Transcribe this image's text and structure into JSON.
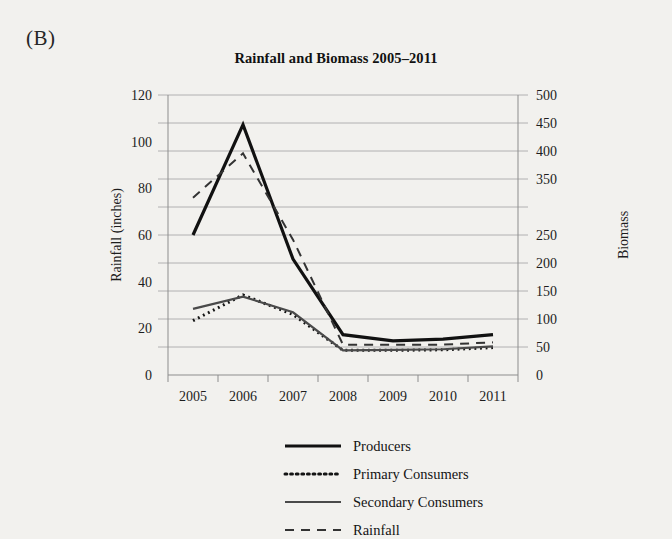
{
  "panel": {
    "label": "(B)"
  },
  "chart_data": {
    "type": "line",
    "title": "Rainfall and Biomass 2005–2011",
    "xlabel": "",
    "ylabel": "Rainfall (inches)",
    "y2label": "Biomass",
    "categories": [
      "2005",
      "2006",
      "2007",
      "2008",
      "2009",
      "2010",
      "2011"
    ],
    "x": [
      2005,
      2006,
      2007,
      2008,
      2009,
      2010,
      2011
    ],
    "ylim": [
      0,
      120
    ],
    "yticks": [
      0,
      20,
      40,
      60,
      80,
      100,
      120
    ],
    "ytick_labels": [
      "0",
      "20",
      "40",
      "60",
      "80",
      "100",
      "120"
    ],
    "y2lim": [
      0,
      500
    ],
    "y2ticks": [
      0,
      50,
      100,
      150,
      200,
      250,
      300,
      350,
      400,
      450,
      500
    ],
    "y2tick_labels": [
      "0",
      "50",
      "100",
      "150",
      "200",
      "250",
      "",
      "350",
      "400",
      "450",
      "500"
    ],
    "grid": true,
    "legend_position": "bottom",
    "series": [
      {
        "name": "Producers",
        "axis": "right",
        "style": "solid-thick",
        "color": "#111111",
        "width": 3.2,
        "values": [
          250,
          447,
          207,
          72,
          61,
          64,
          72
        ]
      },
      {
        "name": "Primary Consumers",
        "axis": "right",
        "style": "dotted",
        "color": "#141414",
        "width": 3.0,
        "values": [
          97,
          143,
          108,
          44,
          44,
          45,
          49
        ]
      },
      {
        "name": "Secondary Consumers",
        "axis": "right",
        "style": "solid-medium",
        "color": "#4a4a4a",
        "width": 2.2,
        "values": [
          118,
          140,
          112,
          44,
          45,
          46,
          51
        ]
      },
      {
        "name": "Rainfall",
        "axis": "left",
        "style": "dashed",
        "color": "#333333",
        "width": 2.0,
        "values": [
          76,
          95,
          58,
          13,
          13,
          13,
          14
        ]
      }
    ],
    "legend": [
      {
        "label": "Producers",
        "style": "solid-thick",
        "color": "#111111"
      },
      {
        "label": "Primary Consumers",
        "style": "dotted",
        "color": "#141414"
      },
      {
        "label": "Secondary Consumers",
        "style": "solid-medium",
        "color": "#4a4a4a"
      },
      {
        "label": "Rainfall",
        "style": "dashed",
        "color": "#333333"
      }
    ]
  },
  "colors": {
    "background": "#f2f1ee",
    "grid": "#a9a9a9",
    "axis": "#8d8d8d",
    "text": "#1a1a1a"
  }
}
